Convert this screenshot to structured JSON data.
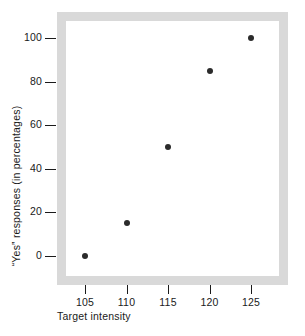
{
  "chart_data": {
    "type": "scatter",
    "title": "",
    "xlabel": "Target intensity",
    "ylabel": "“Yes” responses (in percentages)",
    "x": [
      105,
      110,
      115,
      120,
      125
    ],
    "values": [
      0,
      15,
      50,
      85,
      100
    ],
    "points": [
      {
        "x": 105,
        "y": 0
      },
      {
        "x": 110,
        "y": 15
      },
      {
        "x": 115,
        "y": 50
      },
      {
        "x": 120,
        "y": 85
      },
      {
        "x": 125,
        "y": 100
      }
    ],
    "xticks": [
      "105",
      "110",
      "115",
      "120",
      "125"
    ],
    "yticks": [
      "0",
      "20",
      "40",
      "60",
      "80",
      "100"
    ],
    "xlim": [
      102.5,
      128
    ],
    "ylim": [
      -10,
      110
    ],
    "grid": false,
    "legend": null,
    "marker_color": "#2b2b2b",
    "frame_color": "#d9d9d9",
    "plot_background": "#ffffff"
  },
  "axes": {
    "x": {
      "label": "Target intensity",
      "ticks": [
        {
          "label": "105",
          "value": 105
        },
        {
          "label": "110",
          "value": 110
        },
        {
          "label": "115",
          "value": 115
        },
        {
          "label": "120",
          "value": 120
        },
        {
          "label": "125",
          "value": 125
        }
      ]
    },
    "y": {
      "label": "“Yes” responses (in percentages)",
      "ticks": [
        {
          "label": "100",
          "value": 100
        },
        {
          "label": "80",
          "value": 80
        },
        {
          "label": "60",
          "value": 60
        },
        {
          "label": "40",
          "value": 40
        },
        {
          "label": "20",
          "value": 20
        },
        {
          "label": "0",
          "value": 0
        }
      ]
    }
  }
}
